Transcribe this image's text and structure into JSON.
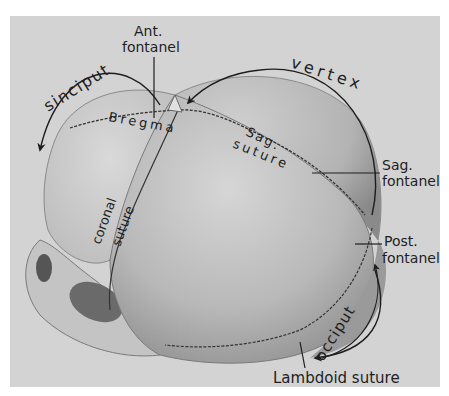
{
  "figure": {
    "colors": {
      "background": "#ffffff",
      "panel": "#d3d3d3",
      "bone_light": "#c9c9c9",
      "bone_shadow": "#8a8a8a",
      "ink": "#1e1e1e"
    }
  },
  "labels": {
    "ant_fontanel_line1": "Ant.",
    "ant_fontanel_line2": "fontanel",
    "sinciput": "sinciput",
    "vertex": "vertex",
    "bregma": "Bregma",
    "sag_suture_line1": "Sag.",
    "sag_suture_line2": "suture",
    "sag_fontanel_line1": "Sag.",
    "sag_fontanel_line2": "fontanel",
    "post_fontanel_line1": "Post.",
    "post_fontanel_line2": "fontanel",
    "coronal_suture_line1": "coronal",
    "coronal_suture_line2": "suture",
    "occiput": "occiput",
    "lambdoid_suture": "Lambdoid suture"
  }
}
